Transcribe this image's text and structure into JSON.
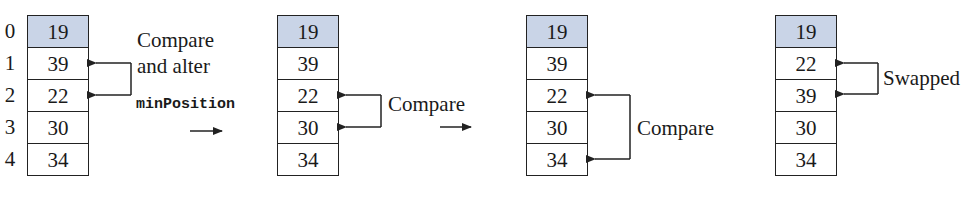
{
  "diagram": {
    "indices": [
      "0",
      "1",
      "2",
      "3",
      "4"
    ],
    "colors": {
      "sorted_fill": "#c9d4e7",
      "line": "#222222"
    },
    "steps": [
      {
        "values": [
          "19",
          "39",
          "22",
          "30",
          "34"
        ],
        "sorted_count": 1,
        "bracket_rows": [
          1,
          2
        ],
        "annotation": [
          "Compare",
          "and alter"
        ],
        "code": "minPosition"
      },
      {
        "values": [
          "19",
          "39",
          "22",
          "30",
          "34"
        ],
        "sorted_count": 1,
        "bracket_rows": [
          2,
          3
        ],
        "annotation": [
          "Compare"
        ]
      },
      {
        "values": [
          "19",
          "39",
          "22",
          "30",
          "34"
        ],
        "sorted_count": 1,
        "bracket_rows": [
          2,
          4
        ],
        "annotation": [
          "Compare"
        ]
      },
      {
        "values": [
          "19",
          "22",
          "39",
          "30",
          "34"
        ],
        "sorted_count": 1,
        "bracket_rows": [
          1,
          2
        ],
        "annotation": [
          "Swapped"
        ]
      }
    ]
  }
}
